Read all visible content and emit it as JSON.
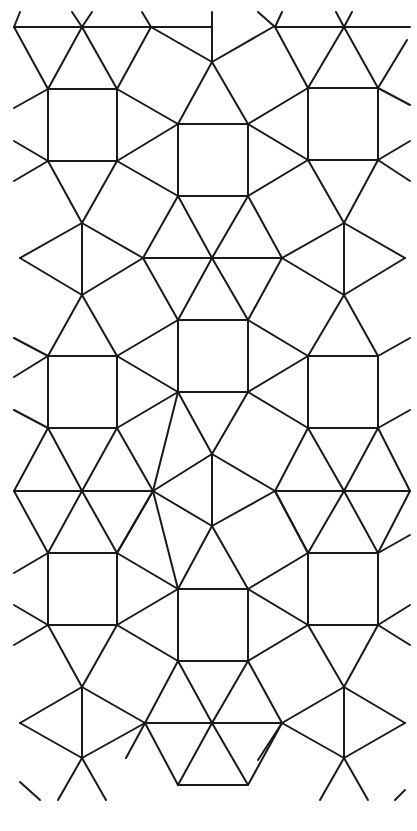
{
  "figure": {
    "stroke_color": "#1a1a1a",
    "background_color": "#ffffff",
    "stroke_width": 2,
    "edges": [
      [
        14,
        27,
        151,
        27
      ],
      [
        151,
        27,
        212,
        27
      ],
      [
        275,
        27,
        344,
        27
      ],
      [
        344,
        27,
        410,
        27
      ],
      [
        14,
        27,
        48,
        89
      ],
      [
        82,
        27,
        48,
        89
      ],
      [
        82,
        27,
        117,
        89
      ],
      [
        151,
        27,
        117,
        89
      ],
      [
        151,
        27,
        212,
        62
      ],
      [
        151,
        27,
        142,
        12
      ],
      [
        82,
        27,
        72,
        12
      ],
      [
        82,
        27,
        92,
        12
      ],
      [
        20,
        12,
        14,
        27
      ],
      [
        212,
        62,
        212,
        12
      ],
      [
        212,
        62,
        178,
        124
      ],
      [
        212,
        62,
        273,
        27
      ],
      [
        212,
        62,
        248,
        124
      ],
      [
        275,
        27,
        308,
        88
      ],
      [
        344,
        27,
        308,
        88
      ],
      [
        344,
        27,
        378,
        88
      ],
      [
        407,
        40,
        378,
        88
      ],
      [
        275,
        27,
        258,
        12
      ],
      [
        275,
        27,
        282,
        12
      ],
      [
        344,
        27,
        336,
        12
      ],
      [
        344,
        27,
        352,
        12
      ],
      [
        48,
        89,
        117,
        89
      ],
      [
        117,
        89,
        117,
        161
      ],
      [
        117,
        161,
        48,
        161
      ],
      [
        48,
        161,
        48,
        89
      ],
      [
        48,
        89,
        14,
        108
      ],
      [
        48,
        161,
        14,
        141
      ],
      [
        48,
        161,
        14,
        181
      ],
      [
        117,
        89,
        178,
        124
      ],
      [
        117,
        161,
        178,
        124
      ],
      [
        117,
        161,
        178,
        196
      ],
      [
        178,
        124,
        248,
        124
      ],
      [
        248,
        124,
        248,
        196
      ],
      [
        248,
        196,
        178,
        196
      ],
      [
        178,
        196,
        178,
        124
      ],
      [
        248,
        124,
        308,
        88
      ],
      [
        248,
        124,
        308,
        160
      ],
      [
        248,
        196,
        308,
        160
      ],
      [
        308,
        88,
        378,
        88
      ],
      [
        378,
        88,
        378,
        160
      ],
      [
        378,
        160,
        308,
        160
      ],
      [
        308,
        160,
        308,
        88
      ],
      [
        378,
        88,
        410,
        105
      ],
      [
        378,
        160,
        410,
        141
      ],
      [
        378,
        160,
        410,
        181
      ],
      [
        48,
        161,
        82,
        223
      ],
      [
        117,
        161,
        82,
        223
      ],
      [
        178,
        196,
        143,
        258
      ],
      [
        248,
        196,
        282,
        258
      ],
      [
        178,
        196,
        212,
        258
      ],
      [
        248,
        196,
        212,
        258
      ],
      [
        308,
        160,
        344,
        223
      ],
      [
        378,
        160,
        344,
        223
      ],
      [
        82,
        223,
        82,
        295
      ],
      [
        82,
        223,
        143,
        258
      ],
      [
        82,
        223,
        20,
        258
      ],
      [
        20,
        258,
        82,
        295
      ],
      [
        82,
        295,
        143,
        258
      ],
      [
        143,
        258,
        212,
        258
      ],
      [
        212,
        258,
        282,
        258
      ],
      [
        282,
        258,
        344,
        223
      ],
      [
        282,
        258,
        344,
        295
      ],
      [
        344,
        223,
        344,
        295
      ],
      [
        344,
        223,
        405,
        258
      ],
      [
        344,
        295,
        405,
        258
      ],
      [
        82,
        295,
        48,
        356
      ],
      [
        82,
        295,
        117,
        356
      ],
      [
        48,
        356,
        117,
        356
      ],
      [
        143,
        258,
        178,
        320
      ],
      [
        212,
        258,
        178,
        320
      ],
      [
        212,
        258,
        248,
        320
      ],
      [
        282,
        258,
        248,
        320
      ],
      [
        344,
        295,
        308,
        356
      ],
      [
        344,
        295,
        378,
        356
      ],
      [
        308,
        356,
        378,
        356
      ],
      [
        48,
        356,
        14,
        338
      ],
      [
        48,
        356,
        14,
        377
      ],
      [
        117,
        356,
        178,
        320
      ],
      [
        178,
        320,
        248,
        320
      ],
      [
        248,
        320,
        248,
        392
      ],
      [
        248,
        392,
        178,
        392
      ],
      [
        178,
        392,
        178,
        320
      ],
      [
        117,
        356,
        117,
        428
      ],
      [
        48,
        356,
        48,
        428
      ],
      [
        48,
        428,
        117,
        428
      ],
      [
        117,
        356,
        178,
        392
      ],
      [
        117,
        428,
        178,
        392
      ],
      [
        248,
        320,
        308,
        356
      ],
      [
        248,
        392,
        308,
        356
      ],
      [
        248,
        392,
        308,
        428
      ],
      [
        308,
        356,
        308,
        428
      ],
      [
        378,
        356,
        378,
        428
      ],
      [
        308,
        428,
        378,
        428
      ],
      [
        378,
        356,
        410,
        338
      ],
      [
        378,
        428,
        410,
        410
      ],
      [
        48,
        428,
        14,
        410
      ],
      [
        48,
        428,
        82,
        491
      ],
      [
        117,
        428,
        82,
        491
      ],
      [
        48,
        428,
        14,
        491
      ],
      [
        117,
        428,
        153,
        491
      ],
      [
        178,
        392,
        153,
        491
      ],
      [
        14,
        491,
        153,
        491
      ],
      [
        14,
        491,
        48,
        553
      ],
      [
        82,
        491,
        48,
        553
      ],
      [
        82,
        491,
        117,
        553
      ],
      [
        153,
        491,
        117,
        553
      ],
      [
        178,
        392,
        212,
        454
      ],
      [
        248,
        392,
        212,
        454
      ],
      [
        212,
        454,
        153,
        491
      ],
      [
        212,
        454,
        212,
        526
      ],
      [
        153,
        491,
        212,
        526
      ],
      [
        212,
        454,
        275,
        491
      ],
      [
        212,
        526,
        275,
        491
      ],
      [
        308,
        428,
        275,
        491
      ],
      [
        308,
        428,
        344,
        491
      ],
      [
        378,
        428,
        344,
        491
      ],
      [
        378,
        428,
        410,
        491
      ],
      [
        275,
        491,
        410,
        491
      ],
      [
        275,
        491,
        308,
        553
      ],
      [
        344,
        491,
        308,
        553
      ],
      [
        344,
        491,
        378,
        553
      ],
      [
        410,
        491,
        378,
        553
      ],
      [
        48,
        553,
        117,
        553
      ],
      [
        117,
        553,
        117,
        625
      ],
      [
        117,
        625,
        48,
        625
      ],
      [
        48,
        625,
        48,
        553
      ],
      [
        48,
        553,
        14,
        573
      ],
      [
        48,
        625,
        14,
        605
      ],
      [
        48,
        625,
        14,
        645
      ],
      [
        117,
        553,
        178,
        589
      ],
      [
        212,
        526,
        178,
        589
      ],
      [
        212,
        526,
        248,
        589
      ],
      [
        153,
        491,
        178,
        589
      ],
      [
        178,
        589,
        248,
        589
      ],
      [
        248,
        589,
        248,
        661
      ],
      [
        248,
        661,
        178,
        661
      ],
      [
        178,
        661,
        178,
        589
      ],
      [
        117,
        553,
        153,
        491
      ],
      [
        117,
        625,
        178,
        589
      ],
      [
        117,
        625,
        178,
        661
      ],
      [
        248,
        589,
        308,
        553
      ],
      [
        248,
        661,
        308,
        625
      ],
      [
        248,
        589,
        308,
        625
      ],
      [
        308,
        553,
        275,
        491
      ],
      [
        308,
        553,
        378,
        553
      ],
      [
        378,
        553,
        378,
        625
      ],
      [
        378,
        625,
        308,
        625
      ],
      [
        308,
        625,
        308,
        553
      ],
      [
        378,
        553,
        410,
        535
      ],
      [
        378,
        625,
        410,
        605
      ],
      [
        378,
        625,
        410,
        645
      ],
      [
        48,
        625,
        82,
        687
      ],
      [
        117,
        625,
        82,
        687
      ],
      [
        82,
        687,
        82,
        758
      ],
      [
        82,
        687,
        20,
        723
      ],
      [
        20,
        723,
        82,
        758
      ],
      [
        82,
        687,
        145,
        723
      ],
      [
        82,
        758,
        145,
        723
      ],
      [
        145,
        723,
        212,
        723
      ],
      [
        178,
        661,
        145,
        723
      ],
      [
        178,
        661,
        212,
        723
      ],
      [
        248,
        661,
        212,
        723
      ],
      [
        248,
        661,
        282,
        723
      ],
      [
        212,
        723,
        282,
        723
      ],
      [
        145,
        723,
        178,
        785
      ],
      [
        212,
        723,
        178,
        785
      ],
      [
        212,
        723,
        248,
        785
      ],
      [
        282,
        723,
        248,
        785
      ],
      [
        178,
        785,
        248,
        785
      ],
      [
        308,
        625,
        344,
        687
      ],
      [
        378,
        625,
        344,
        687
      ],
      [
        344,
        687,
        344,
        758
      ],
      [
        344,
        687,
        282,
        723
      ],
      [
        344,
        758,
        282,
        723
      ],
      [
        344,
        687,
        405,
        723
      ],
      [
        344,
        758,
        405,
        723
      ],
      [
        82,
        758,
        58,
        800
      ],
      [
        82,
        758,
        106,
        800
      ],
      [
        20,
        782,
        40,
        800
      ],
      [
        145,
        723,
        126,
        758
      ],
      [
        344,
        758,
        320,
        800
      ],
      [
        344,
        758,
        368,
        800
      ],
      [
        282,
        723,
        258,
        760
      ],
      [
        405,
        790,
        395,
        800
      ]
    ]
  }
}
